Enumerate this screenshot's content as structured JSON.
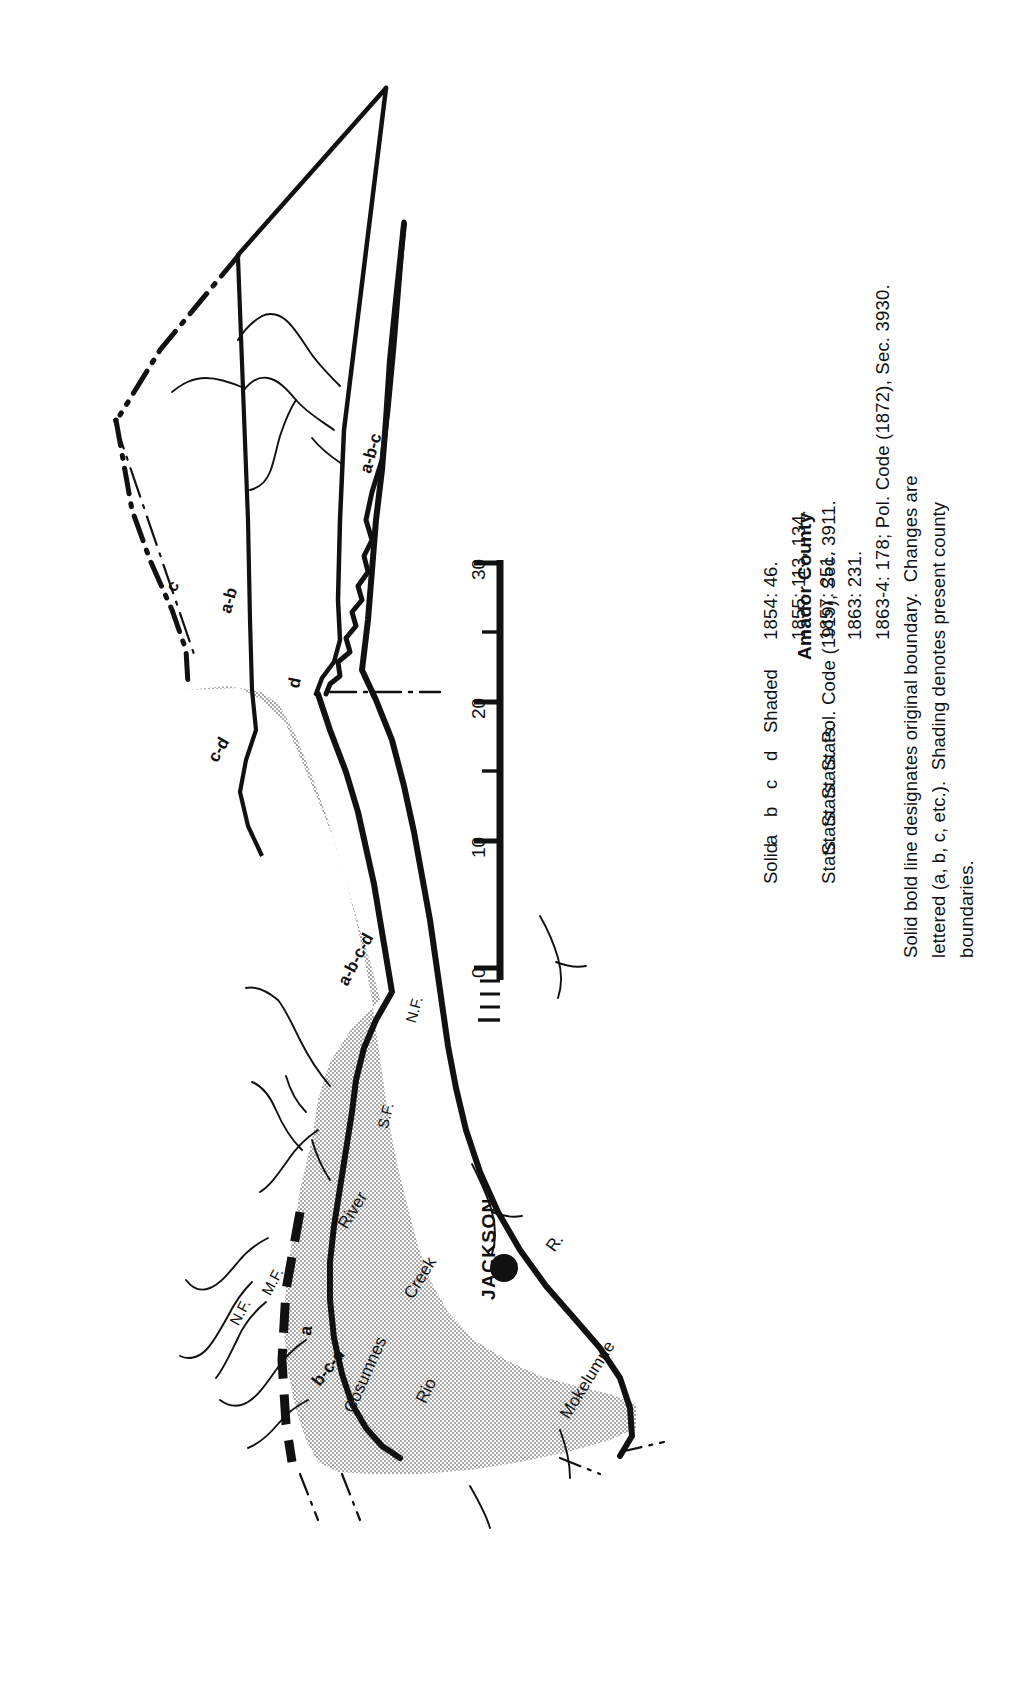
{
  "figure": {
    "title": "Amador County",
    "orientation_note": "plate printed sideways; all lettering reads bottom-to-top"
  },
  "legend": {
    "rows": [
      {
        "key": "Solid",
        "source": "Stats.",
        "citation": "1854: 46."
      },
      {
        "key": "a",
        "source": "Stats.",
        "citation": "1855: 113, 134."
      },
      {
        "key": "b",
        "source": "Stats.",
        "citation": "1857: 251."
      },
      {
        "key": "c",
        "source": "Stats.",
        "citation": "1863: 231."
      },
      {
        "key": "d",
        "source": "Stats.",
        "citation": "1863-4: 178; Pol. Code (1872), Sec. 3930."
      },
      {
        "key": "Shaded",
        "source": "Pol. Code (1919), Sec. 3911.",
        "citation": ""
      }
    ],
    "notes": [
      "Solid bold line designates original boundary.  Changes are",
      "lettered (a, b, c, etc.).  Shading denotes present county",
      "boundaries."
    ]
  },
  "scale": {
    "ticks": [
      {
        "value": "0",
        "major": true
      },
      {
        "value": "10",
        "major": true
      },
      {
        "value": "20",
        "major": true
      },
      {
        "value": "30",
        "major": true
      }
    ],
    "minor_count_per_interval": 4,
    "units_label": ""
  },
  "map": {
    "town": {
      "name": "JACKSON",
      "marker": "filled-circle"
    },
    "boundary_labels": [
      {
        "text": "a-b-c",
        "id": "label-abc"
      },
      {
        "text": "a-b",
        "id": "label-ab"
      },
      {
        "text": "d",
        "id": "label-d"
      },
      {
        "text": "c-d",
        "id": "label-cd"
      },
      {
        "text": "c",
        "id": "label-c"
      },
      {
        "text": "a-b-c-d",
        "id": "label-abcd"
      },
      {
        "text": "b-c-d",
        "id": "label-bcd"
      },
      {
        "text": "a",
        "id": "label-a"
      }
    ],
    "hydrography": [
      {
        "text": "Cosumnes",
        "id": "label-cosumnes"
      },
      {
        "text": "River",
        "id": "label-river"
      },
      {
        "text": "N.F.",
        "id": "label-nf-cosumnes"
      },
      {
        "text": "M.F.",
        "id": "label-mf-cosumnes"
      },
      {
        "text": "S.F.",
        "id": "label-sf"
      },
      {
        "text": "N.F.",
        "id": "label-nf"
      },
      {
        "text": "Rio",
        "id": "label-rio"
      },
      {
        "text": "Creek",
        "id": "label-creek"
      },
      {
        "text": "Mokelumne",
        "id": "label-mokelumne"
      },
      {
        "text": "R.",
        "id": "label-r"
      }
    ]
  },
  "style": {
    "ink": "#111111",
    "paper": "#ffffff",
    "shading": "#c9c9c9"
  }
}
